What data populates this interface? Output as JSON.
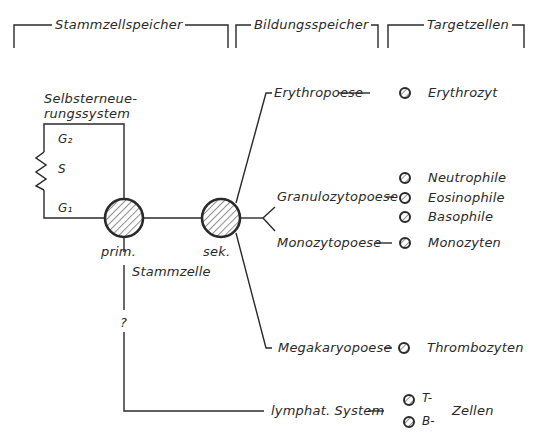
{
  "headers": {
    "stem_cell_pool": "Stammzellspeicher",
    "formation_pool": "Bildungsspeicher",
    "target_cells": "Targetzellen"
  },
  "self_renewal": {
    "title_line1": "Selbsterneue-",
    "title_line2": "rungssystem",
    "phase_g2": "G₂",
    "phase_s": "S",
    "phase_g1": "G₁"
  },
  "stem_cells": {
    "primary_label": "prim.",
    "secondary_label": "sek.",
    "stem_cell_label": "Stammzelle",
    "unknown_marker": "?"
  },
  "lineages": [
    {
      "process": "Erythropoese",
      "cells": [
        "Erythrozyt"
      ]
    },
    {
      "process": "Granulozytopoese",
      "cells": [
        "Neutrophile",
        "Eosinophile",
        "Basophile"
      ]
    },
    {
      "process": "Monozytopoese",
      "cells": [
        "Monozyten"
      ]
    },
    {
      "process": "Megakaryopoese",
      "cells": [
        "Thrombozyten"
      ]
    },
    {
      "process": "lymphat. System",
      "cells": [
        "T-",
        "B-"
      ],
      "cells_suffix": "Zellen"
    }
  ],
  "colors": {
    "line": "#2a2a2a",
    "background": "#ffffff"
  }
}
